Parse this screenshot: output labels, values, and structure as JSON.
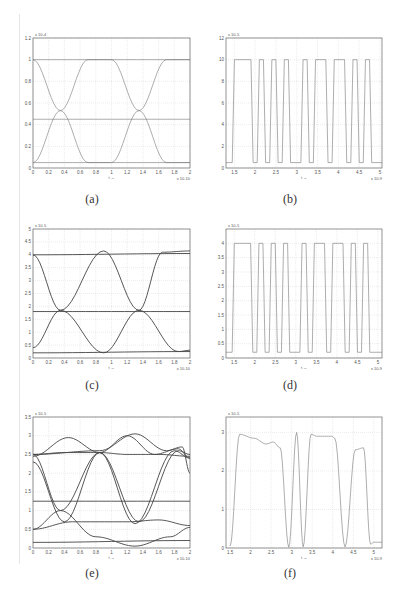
{
  "figure": {
    "captions": [
      "(a)",
      "(b)",
      "(c)",
      "(d)",
      "(e)",
      "(f)"
    ]
  },
  "chart_data": [
    {
      "id": "a",
      "type": "line",
      "title": "",
      "caption": "(a)",
      "xlabel": "t →",
      "ylabel": "",
      "x_exponent": "x 10^-10",
      "y_exponent": "x 10^-4",
      "xlim": [
        0,
        2
      ],
      "ylim": [
        0,
        1.2
      ],
      "xticks": [
        "0",
        "0.2",
        "0.4",
        "0.6",
        "0.8",
        "1",
        "1.2",
        "1.4",
        "1.6",
        "1.8",
        "2"
      ],
      "yticks": [
        "0",
        "0.2",
        "0.4",
        "0.6",
        "0.8",
        "1",
        "1.2"
      ],
      "grid": true,
      "series": [
        {
          "name": "high",
          "x": [
            0,
            2
          ],
          "y": [
            1.0,
            1.0
          ]
        },
        {
          "name": "low",
          "x": [
            0,
            2
          ],
          "y": [
            0.05,
            0.05
          ]
        },
        {
          "name": "threshold",
          "x": [
            0,
            2
          ],
          "y": [
            0.45,
            0.45
          ]
        },
        {
          "name": "fall-rise",
          "x": [
            0,
            0.35,
            0.7,
            1.0,
            1.35,
            1.7,
            2.0
          ],
          "y": [
            1.0,
            0.53,
            0.05,
            0.05,
            0.53,
            1.0,
            1.0
          ]
        },
        {
          "name": "rise-fall",
          "x": [
            0,
            0.35,
            0.7,
            1.0,
            1.35,
            1.7,
            2.0
          ],
          "y": [
            0.05,
            0.53,
            1.0,
            1.0,
            0.53,
            0.05,
            0.05
          ]
        }
      ]
    },
    {
      "id": "b",
      "type": "line",
      "title": "",
      "caption": "(b)",
      "xlabel": "t →",
      "ylabel": "",
      "x_exponent": "x 10^-9",
      "y_exponent": "x 10^-5",
      "xlim": [
        1.3,
        5.05
      ],
      "ylim": [
        0,
        12
      ],
      "xticks": [
        "1.5",
        "2",
        "2.5",
        "3",
        "3.5",
        "4",
        "4.5",
        "5"
      ],
      "yticks": [
        "0",
        "2",
        "4",
        "6",
        "8",
        "10",
        "12"
      ],
      "grid": true,
      "series": [
        {
          "name": "bit-stream",
          "bits": [
            0,
            1,
            1,
            1,
            0,
            1,
            0,
            1,
            0,
            1,
            0,
            0,
            1,
            0,
            1,
            1,
            0,
            1,
            1,
            0,
            1,
            0,
            1,
            0,
            0
          ],
          "high": 10,
          "low": 0.5,
          "x_start": 1.3,
          "bit_period": 0.15
        }
      ]
    },
    {
      "id": "c",
      "type": "line",
      "title": "",
      "caption": "(c)",
      "xlabel": "t →",
      "ylabel": "",
      "x_exponent": "x 10^-10",
      "y_exponent": "x 10^-5",
      "xlim": [
        0,
        2
      ],
      "ylim": [
        0,
        5
      ],
      "xticks": [
        "0",
        "0.2",
        "0.4",
        "0.6",
        "0.8",
        "1",
        "1.2",
        "1.4",
        "1.6",
        "1.8",
        "2"
      ],
      "yticks": [
        "0",
        "0.5",
        "1",
        "1.5",
        "2",
        "2.5",
        "3",
        "3.5",
        "4",
        "4.5",
        "5"
      ],
      "grid": true,
      "series": [
        {
          "name": "high",
          "x": [
            0,
            2
          ],
          "y": [
            4.0,
            4.05
          ]
        },
        {
          "name": "low",
          "x": [
            0,
            2
          ],
          "y": [
            0.2,
            0.25
          ]
        },
        {
          "name": "threshold",
          "x": [
            0,
            2
          ],
          "y": [
            1.8,
            1.8
          ]
        },
        {
          "name": "fall-rise",
          "x": [
            0,
            0.35,
            0.9,
            1.35,
            1.65,
            2.0
          ],
          "y": [
            4.0,
            1.85,
            0.2,
            1.85,
            4.1,
            4.15
          ]
        },
        {
          "name": "rise-fall",
          "x": [
            0,
            0.35,
            0.9,
            1.35,
            1.85,
            2.0
          ],
          "y": [
            0.4,
            1.85,
            4.15,
            1.85,
            0.25,
            0.3
          ]
        }
      ]
    },
    {
      "id": "d",
      "type": "line",
      "title": "",
      "caption": "(d)",
      "xlabel": "t →",
      "ylabel": "",
      "x_exponent": "x 10^-9",
      "y_exponent": "x 10^-5",
      "xlim": [
        1.3,
        5.1
      ],
      "ylim": [
        0,
        4.5
      ],
      "xticks": [
        "1.5",
        "2",
        "2.5",
        "3",
        "3.5",
        "4",
        "4.5",
        "5"
      ],
      "yticks": [
        "0",
        "0.5",
        "1",
        "1.5",
        "2",
        "2.5",
        "3",
        "3.5",
        "4"
      ],
      "grid": true,
      "series": [
        {
          "name": "bit-stream",
          "bits": [
            0,
            1,
            1,
            1,
            0,
            1,
            0,
            1,
            0,
            1,
            0,
            0,
            1,
            0,
            1,
            1,
            0,
            1,
            1,
            0,
            1,
            0,
            1,
            0,
            0
          ],
          "high": 4.0,
          "low": 0.2,
          "x_start": 1.3,
          "bit_period": 0.15
        }
      ]
    },
    {
      "id": "e",
      "type": "line",
      "title": "",
      "caption": "(e)",
      "xlabel": "t →",
      "ylabel": "",
      "x_exponent": "x 10^-10",
      "y_exponent": "x 10^-5",
      "xlim": [
        0,
        2
      ],
      "ylim": [
        0,
        3.5
      ],
      "xticks": [
        "0",
        "0.2",
        "0.4",
        "0.6",
        "0.8",
        "1",
        "1.2",
        "1.4",
        "1.6",
        "1.8",
        "2"
      ],
      "yticks": [
        "0",
        "0.5",
        "1",
        "1.5",
        "2",
        "2.5",
        "3",
        "3.5"
      ],
      "grid": true,
      "series": [
        {
          "name": "upper-rail",
          "x": [
            0,
            0.4,
            0.85,
            1.2,
            1.6,
            2.0
          ],
          "y": [
            2.5,
            2.55,
            2.55,
            2.5,
            2.5,
            2.45
          ]
        },
        {
          "name": "hump-1",
          "x": [
            0,
            0.45,
            0.85,
            1.2,
            1.55,
            1.85,
            2.0
          ],
          "y": [
            2.45,
            2.95,
            2.55,
            3.0,
            2.5,
            2.65,
            2.4
          ]
        },
        {
          "name": "hump-2",
          "x": [
            0,
            0.85,
            1.3,
            1.7,
            1.9,
            2.0
          ],
          "y": [
            2.5,
            2.6,
            3.05,
            2.6,
            2.7,
            2.0
          ]
        },
        {
          "name": "lower-rail",
          "x": [
            0,
            2
          ],
          "y": [
            0.15,
            0.2
          ]
        },
        {
          "name": "mid-rail",
          "x": [
            0,
            0.5,
            1.2,
            1.6,
            2.0
          ],
          "y": [
            0.5,
            0.7,
            0.7,
            0.75,
            0.6
          ]
        },
        {
          "name": "threshold",
          "x": [
            0,
            2
          ],
          "y": [
            1.25,
            1.25
          ]
        },
        {
          "name": "fall-1",
          "x": [
            0,
            0.35,
            0.8,
            1.3,
            1.75,
            2.0
          ],
          "y": [
            2.5,
            1.0,
            0.3,
            0.05,
            0.3,
            0.55
          ]
        },
        {
          "name": "rise-1",
          "x": [
            0,
            0.35,
            0.85,
            1.35,
            1.85,
            2.0
          ],
          "y": [
            0.5,
            1.0,
            2.55,
            0.7,
            2.6,
            2.5
          ]
        },
        {
          "name": "fall-2",
          "x": [
            0,
            0.4,
            0.85,
            1.3,
            1.8,
            2.0
          ],
          "y": [
            2.3,
            0.7,
            2.55,
            0.65,
            2.6,
            2.4
          ]
        }
      ]
    },
    {
      "id": "f",
      "type": "line",
      "title": "",
      "caption": "(f)",
      "xlabel": "t →",
      "ylabel": "",
      "x_exponent": "x 10^-9",
      "y_exponent": "x 10^-5",
      "xlim": [
        1.4,
        5.2
      ],
      "ylim": [
        0,
        3.4
      ],
      "xticks": [
        "1.5",
        "2",
        "2.5",
        "3",
        "3.5",
        "4",
        "4.5",
        "5"
      ],
      "yticks": [
        "0",
        "1",
        "2",
        "3"
      ],
      "grid": true,
      "series": [
        {
          "name": "bit-stream",
          "peaks_x": [
            1.5,
            1.73,
            2.08,
            2.38,
            2.55,
            2.72,
            2.93,
            3.12,
            3.28,
            3.47,
            3.62,
            3.82,
            3.98,
            4.05,
            4.3,
            4.55,
            4.75,
            4.92,
            5.0,
            5.2
          ],
          "peaks_y": [
            0.05,
            2.95,
            2.85,
            2.7,
            2.75,
            2.6,
            0.02,
            3.0,
            0.03,
            2.95,
            2.9,
            2.9,
            2.9,
            2.85,
            0.03,
            2.55,
            2.6,
            0.1,
            0.15,
            0.15
          ]
        }
      ]
    }
  ]
}
